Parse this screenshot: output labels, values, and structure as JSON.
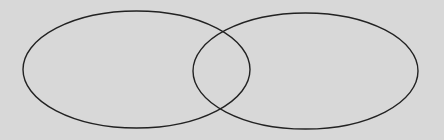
{
  "diagram": {
    "type": "venn",
    "background": "#d8d8d8",
    "stroke": "#222222",
    "sets": [
      {
        "id": "left",
        "label": "",
        "cx": 136.5,
        "cy": 69.5,
        "rx": 113.5,
        "ry": 58.5
      },
      {
        "id": "right",
        "label": "",
        "cx": 305.5,
        "cy": 71,
        "rx": 112.5,
        "ry": 58
      }
    ]
  }
}
